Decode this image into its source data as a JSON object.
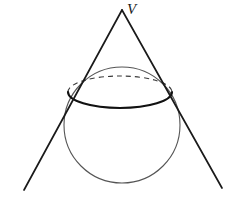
{
  "figure": {
    "background_color": "#ffffff",
    "width": 247,
    "height": 201,
    "labels": [
      {
        "id": "vertex",
        "text": "V",
        "x": 128,
        "y": 9,
        "style": "italic-serif",
        "color": "#1a1a1a"
      }
    ],
    "colors": {
      "stroke_dark": "#1a1a1a",
      "stroke_light": "#555555",
      "stroke_dashed": "#3a3a3a",
      "background": "#ffffff"
    },
    "geometry": {
      "apex": {
        "x": 122,
        "y": 10
      },
      "tangent_line_left": {
        "x1": 122,
        "y1": 10,
        "x2": 24,
        "y2": 190
      },
      "tangent_line_right": {
        "x1": 122,
        "y1": 10,
        "x2": 222,
        "y2": 188
      },
      "tangency_point_left": {
        "x": 68,
        "y": 92
      },
      "tangency_point_right": {
        "x": 172,
        "y": 92
      },
      "sphere": {
        "cx": 122,
        "cy": 125,
        "r": 58,
        "stroke_width": 1
      },
      "contact_ellipse": {
        "cx": 120,
        "cy": 96,
        "rx": 52,
        "ry": 16,
        "front_arc_stroke_width": 2,
        "back_arc_dash": "5 4",
        "back_arc_stroke_width": 1
      }
    }
  }
}
